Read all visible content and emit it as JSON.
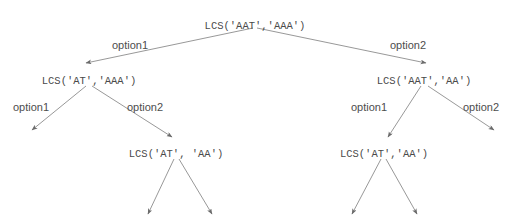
{
  "diagram": {
    "colors": {
      "background": "#ffffff",
      "node_text": "#4a4a4a",
      "label_text": "#4d4d4d",
      "edge_line": "#8c8c8c",
      "arrow_head": "#6b6b6b"
    },
    "nodes": [
      {
        "id": "root",
        "label": "LCS('AAT','AAA')",
        "x": 255,
        "y": 20
      },
      {
        "id": "l1",
        "label": "LCS('AT','AAA')",
        "x": 89,
        "y": 75
      },
      {
        "id": "r1",
        "label": "LCS('AAT','AA')",
        "x": 424,
        "y": 75
      },
      {
        "id": "l2",
        "label": "LCS('AT', 'AA')",
        "x": 176,
        "y": 148
      },
      {
        "id": "r2",
        "label": "LCS('AT','AA')",
        "x": 384,
        "y": 148
      }
    ],
    "edge_labels": [
      {
        "id": "root-option1",
        "text": "option1",
        "x": 130,
        "y": 39
      },
      {
        "id": "root-option2",
        "text": "option2",
        "x": 408,
        "y": 39
      },
      {
        "id": "l1-option1",
        "text": "option1",
        "x": 31,
        "y": 101
      },
      {
        "id": "l1-option2",
        "text": "option2",
        "x": 145,
        "y": 101
      },
      {
        "id": "r1-option1",
        "text": "option1",
        "x": 369,
        "y": 101
      },
      {
        "id": "r1-option2",
        "text": "option2",
        "x": 481,
        "y": 101
      }
    ],
    "edges": [
      {
        "id": "root-to-l1",
        "from": "root",
        "to": "l1",
        "x1": 253,
        "y1": 28,
        "x2": 86,
        "y2": 63
      },
      {
        "id": "root-to-r1",
        "from": "root",
        "to": "r1",
        "x1": 257,
        "y1": 28,
        "x2": 426,
        "y2": 63
      },
      {
        "id": "l1-to-left",
        "from": "l1",
        "to": "dangle1",
        "x1": 86,
        "y1": 86,
        "x2": 32,
        "y2": 130
      },
      {
        "id": "l1-to-l2",
        "from": "l1",
        "to": "l2",
        "x1": 92,
        "y1": 86,
        "x2": 172,
        "y2": 137
      },
      {
        "id": "r1-to-r2",
        "from": "r1",
        "to": "r2",
        "x1": 421,
        "y1": 86,
        "x2": 388,
        "y2": 137
      },
      {
        "id": "r1-to-right",
        "from": "r1",
        "to": "dangle2",
        "x1": 428,
        "y1": 86,
        "x2": 494,
        "y2": 130
      },
      {
        "id": "l2-to-left",
        "from": "l2",
        "to": "dangle3",
        "x1": 174,
        "y1": 159,
        "x2": 148,
        "y2": 214
      },
      {
        "id": "l2-to-right",
        "from": "l2",
        "to": "dangle4",
        "x1": 179,
        "y1": 159,
        "x2": 212,
        "y2": 214
      },
      {
        "id": "r2-to-left",
        "from": "r2",
        "to": "dangle5",
        "x1": 381,
        "y1": 159,
        "x2": 352,
        "y2": 214
      },
      {
        "id": "r2-to-right",
        "from": "r2",
        "to": "dangle6",
        "x1": 386,
        "y1": 159,
        "x2": 417,
        "y2": 214
      }
    ]
  }
}
